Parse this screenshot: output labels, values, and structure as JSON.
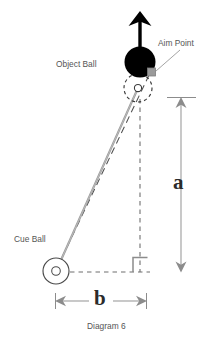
{
  "diagram": {
    "caption": "Diagram 6",
    "labels": {
      "object_ball": "Object Ball",
      "aim_point": "Aim Point",
      "cue_ball": "Cue Ball",
      "dimension_a": "a",
      "dimension_b": "b"
    },
    "colors": {
      "background": "#ffffff",
      "object_ball_fill": "#000000",
      "aim_point_fill": "#9a9a9a",
      "line_gray": "#8c8c8c",
      "line_dark": "#555555",
      "text": "#555555",
      "dimension_text": "#2b2b2b"
    },
    "elements": {
      "direction_arrow": "up-arrow-icon",
      "object_ball": "filled-ball-icon",
      "ghost_ball": "dashed-ball-icon",
      "aim_point": "aim-point-marker-icon",
      "cue_ball": "cue-ball-icon",
      "right_angle": "right-angle-marker-icon",
      "vertical_dimension": "dimension-arrow-vertical-icon",
      "horizontal_dimension": "dimension-arrow-horizontal-icon"
    }
  }
}
